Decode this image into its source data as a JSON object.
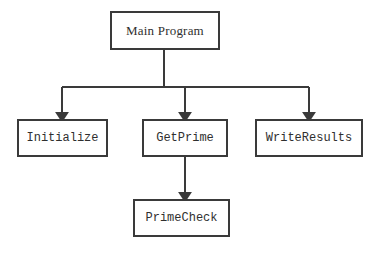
{
  "diagram": {
    "type": "program-structure-chart",
    "background_color": "#ffffff",
    "line_color": "#3a3a3a",
    "text_color": "#2f2f2f",
    "nodes": [
      {
        "id": "main-program",
        "label": "Main Program",
        "font": "serif",
        "x": 110,
        "y": 11,
        "w": 110,
        "h": 39
      },
      {
        "id": "initialize",
        "label": "Initialize",
        "font": "mono",
        "x": 17,
        "y": 119,
        "w": 91,
        "h": 38
      },
      {
        "id": "getprime",
        "label": "GetPrime",
        "font": "mono",
        "x": 142,
        "y": 119,
        "w": 86,
        "h": 38
      },
      {
        "id": "writeresults",
        "label": "WriteResults",
        "font": "mono",
        "x": 255,
        "y": 119,
        "w": 108,
        "h": 38
      },
      {
        "id": "primecheck",
        "label": "PrimeCheck",
        "font": "mono",
        "x": 133,
        "y": 199,
        "w": 97,
        "h": 38
      }
    ],
    "connectors": [
      {
        "id": "main-to-bus",
        "from": "main-program",
        "to": "bus",
        "kind": "stem"
      },
      {
        "id": "bus-to-initialize",
        "from": "main-program",
        "to": "initialize",
        "kind": "arrow"
      },
      {
        "id": "bus-to-getprime",
        "from": "main-program",
        "to": "getprime",
        "kind": "arrow"
      },
      {
        "id": "bus-to-writeresults",
        "from": "main-program",
        "to": "writeresults",
        "kind": "arrow"
      },
      {
        "id": "getprime-to-primecheck",
        "from": "getprime",
        "to": "primecheck",
        "kind": "arrow"
      }
    ]
  }
}
